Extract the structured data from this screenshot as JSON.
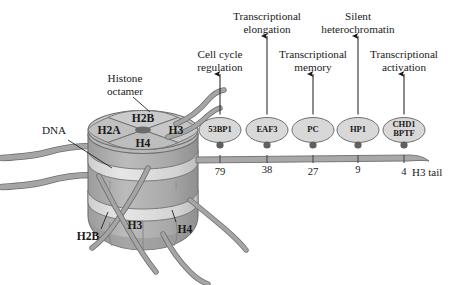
{
  "figure": {
    "background_color": "#ffffff",
    "ink_color": "#1a1a1a"
  },
  "nucleosome": {
    "labels": {
      "dna": "DNA",
      "histone_octamer_line1": "Histone",
      "histone_octamer_line2": "octamer",
      "top_h2b": "H2B",
      "top_h2a": "H2A",
      "top_h3": "H3",
      "top_h4": "H4",
      "bottom_h2b": "H2B",
      "bottom_h3": "H3",
      "bottom_h4": "H4"
    },
    "colors": {
      "disc_light": "#c9c9c9",
      "disc_mid": "#b4b4b4",
      "disc_dark": "#9d9d9d",
      "dna_band": "#dcdcdc",
      "tail_gray": "#a3a3a3",
      "outline": "#6e6e6e",
      "center_dark": "#6b6b6b"
    }
  },
  "h3_tail": {
    "label": "H3 tail",
    "color": "#a8a8a8",
    "residues": [
      {
        "number": "79",
        "x": 220
      },
      {
        "number": "38",
        "x": 267
      },
      {
        "number": "27",
        "x": 313
      },
      {
        "number": "9",
        "x": 358
      },
      {
        "number": "4",
        "x": 404
      }
    ]
  },
  "readers": [
    {
      "name": "53BP1",
      "name_line2": "",
      "residue": "79",
      "x": 220,
      "function_line1": "Cell cycle",
      "function_line2": "regulation",
      "function_row": "lower"
    },
    {
      "name": "EAF3",
      "name_line2": "",
      "residue": "38",
      "x": 267,
      "function_line1": "Transcriptional",
      "function_line2": "elongation",
      "function_row": "upper"
    },
    {
      "name": "PC",
      "name_line2": "",
      "residue": "27",
      "x": 313,
      "function_line1": "Transcriptional",
      "function_line2": "memory",
      "function_row": "lower"
    },
    {
      "name": "HP1",
      "name_line2": "",
      "residue": "9",
      "x": 358,
      "function_line1": "Silent",
      "function_line2": "heterochromatin",
      "function_row": "upper"
    },
    {
      "name": "CHD1",
      "name_line2": "BPTF",
      "residue": "4",
      "x": 404,
      "function_line1": "Transcriptional",
      "function_line2": "activation",
      "function_row": "lower"
    }
  ]
}
